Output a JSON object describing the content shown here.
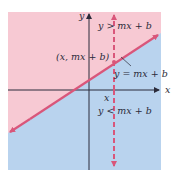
{
  "diagram": {
    "type": "half-plane-inequality",
    "colors": {
      "upper_region": "#f7c9d3",
      "lower_region": "#b9d3ee",
      "boundary_line": "#d9567a",
      "dashed_line": "#d9567a",
      "axes": "#2b2b3a",
      "text": "#2b2b3a"
    },
    "axes": {
      "x_label": "x",
      "y_label": "y"
    },
    "labels": {
      "upper": "y > mx + b",
      "point": "(x, mx + b)",
      "line": "y = mx + b",
      "x_tick": "x",
      "lower": "y < mx + b"
    }
  }
}
